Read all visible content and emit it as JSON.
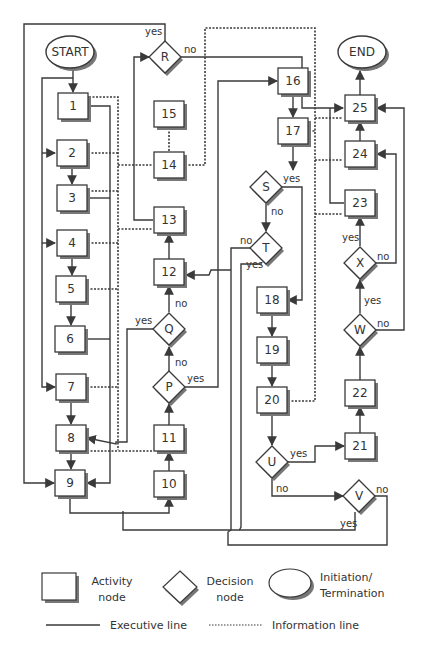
{
  "diagram": {
    "type": "flowchart",
    "terminals": [
      {
        "id": "start",
        "label": "START",
        "cx": 70,
        "cy": 52
      },
      {
        "id": "end",
        "label": "END",
        "cx": 362,
        "cy": 52
      }
    ],
    "activity_nodes": [
      {
        "id": "1",
        "label": "1",
        "cx": 73,
        "cy": 106
      },
      {
        "id": "2",
        "label": "2",
        "cx": 72,
        "cy": 153
      },
      {
        "id": "3",
        "label": "3",
        "cx": 72,
        "cy": 198
      },
      {
        "id": "4",
        "label": "4",
        "cx": 72,
        "cy": 243
      },
      {
        "id": "5",
        "label": "5",
        "cx": 71,
        "cy": 289
      },
      {
        "id": "6",
        "label": "6",
        "cx": 70,
        "cy": 339
      },
      {
        "id": "7",
        "label": "7",
        "cx": 71,
        "cy": 387
      },
      {
        "id": "8",
        "label": "8",
        "cx": 71,
        "cy": 438
      },
      {
        "id": "9",
        "label": "9",
        "cx": 70,
        "cy": 483
      },
      {
        "id": "10",
        "label": "10",
        "cx": 169,
        "cy": 484
      },
      {
        "id": "11",
        "label": "11",
        "cx": 169,
        "cy": 438
      },
      {
        "id": "12",
        "label": "12",
        "cx": 169,
        "cy": 272
      },
      {
        "id": "13",
        "label": "13",
        "cx": 169,
        "cy": 220
      },
      {
        "id": "14",
        "label": "14",
        "cx": 169,
        "cy": 165
      },
      {
        "id": "15",
        "label": "15",
        "cx": 169,
        "cy": 114
      },
      {
        "id": "16",
        "label": "16",
        "cx": 293,
        "cy": 81
      },
      {
        "id": "17",
        "label": "17",
        "cx": 293,
        "cy": 131
      },
      {
        "id": "18",
        "label": "18",
        "cx": 272,
        "cy": 300
      },
      {
        "id": "19",
        "label": "19",
        "cx": 272,
        "cy": 350
      },
      {
        "id": "20",
        "label": "20",
        "cx": 272,
        "cy": 400
      },
      {
        "id": "21",
        "label": "21",
        "cx": 360,
        "cy": 446
      },
      {
        "id": "22",
        "label": "22",
        "cx": 360,
        "cy": 393
      },
      {
        "id": "23",
        "label": "23",
        "cx": 360,
        "cy": 203
      },
      {
        "id": "24",
        "label": "24",
        "cx": 360,
        "cy": 154
      },
      {
        "id": "25",
        "label": "25",
        "cx": 360,
        "cy": 108
      }
    ],
    "decision_nodes": [
      {
        "id": "R",
        "label": "R",
        "cx": 165,
        "cy": 57
      },
      {
        "id": "S",
        "label": "S",
        "cx": 266,
        "cy": 187
      },
      {
        "id": "T",
        "label": "T",
        "cx": 266,
        "cy": 248
      },
      {
        "id": "Q",
        "label": "Q",
        "cx": 169,
        "cy": 329
      },
      {
        "id": "P",
        "label": "P",
        "cx": 169,
        "cy": 387
      },
      {
        "id": "U",
        "label": "U",
        "cx": 272,
        "cy": 462
      },
      {
        "id": "V",
        "label": "V",
        "cx": 359,
        "cy": 496
      },
      {
        "id": "W",
        "label": "W",
        "cx": 360,
        "cy": 330
      },
      {
        "id": "X",
        "label": "X",
        "cx": 360,
        "cy": 263
      }
    ],
    "edge_labels": [
      {
        "text": "yes",
        "x": 145,
        "y": 35
      },
      {
        "text": "no",
        "x": 184,
        "y": 53
      },
      {
        "text": "yes",
        "x": 283,
        "y": 182
      },
      {
        "text": "no",
        "x": 271,
        "y": 215
      },
      {
        "text": "no",
        "x": 240,
        "y": 244
      },
      {
        "text": "yes",
        "x": 246,
        "y": 268
      },
      {
        "text": "no",
        "x": 175,
        "y": 307
      },
      {
        "text": "yes",
        "x": 135,
        "y": 324
      },
      {
        "text": "no",
        "x": 175,
        "y": 366
      },
      {
        "text": "yes",
        "x": 187,
        "y": 382
      },
      {
        "text": "yes",
        "x": 290,
        "y": 457
      },
      {
        "text": "no",
        "x": 276,
        "y": 492
      },
      {
        "text": "no",
        "x": 376,
        "y": 493
      },
      {
        "text": "yes",
        "x": 340,
        "y": 527
      },
      {
        "text": "yes",
        "x": 342,
        "y": 241
      },
      {
        "text": "no",
        "x": 377,
        "y": 260
      },
      {
        "text": "yes",
        "x": 364,
        "y": 304
      },
      {
        "text": "no",
        "x": 377,
        "y": 327
      }
    ]
  },
  "legend": {
    "activity_node": "Activity node",
    "activity_line1": "Activity",
    "activity_line2": "node",
    "decision_line1": "Decision",
    "decision_line2": "node",
    "terminal_line1": "Initiation/",
    "terminal_line2": "Termination",
    "executive_line": "Executive line",
    "information_line": "Information line"
  },
  "colors": {
    "stroke": "#3a3a3a",
    "shadow": "#7a7a7a",
    "fill": "#ffffff",
    "text": "#333333"
  }
}
